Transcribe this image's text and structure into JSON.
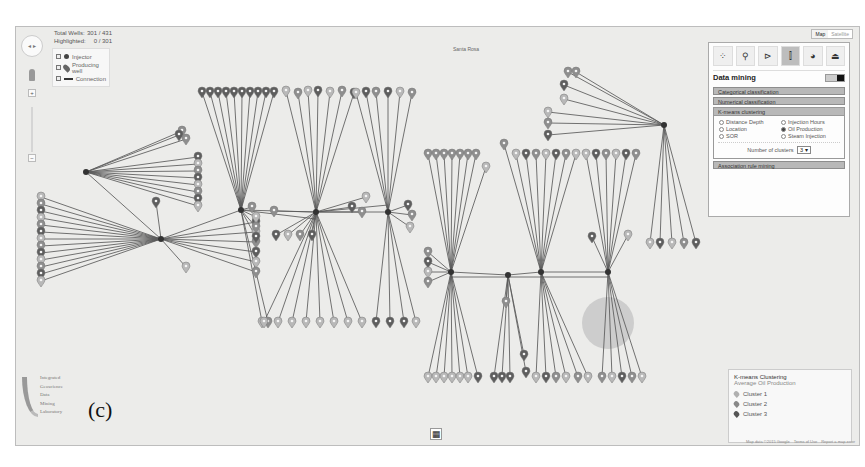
{
  "window": {
    "figure_label": "(c)"
  },
  "map": {
    "place_label": "Santa Rosa",
    "map_type": {
      "options": [
        "Map",
        "Satellite"
      ],
      "selected": "Map"
    },
    "credits": [
      "Map data ©2015 Google",
      "Terms of Use",
      "Report a map error"
    ],
    "view_grid_icon": "grid-icon"
  },
  "stats": {
    "total_label": "Total Wells:",
    "total_value": "301 / 431",
    "highlighted_label": "Highlighted:",
    "highlighted_value": "0 / 301"
  },
  "layer_legend": {
    "items": [
      {
        "label": "Injector",
        "icon": "dot-icon",
        "checked": true
      },
      {
        "label": "Producing well",
        "icon": "pin-icon",
        "checked": true
      },
      {
        "label": "Connection",
        "icon": "line-icon",
        "checked": true
      }
    ]
  },
  "controls": {
    "zoom_in": "+",
    "zoom_out": "−",
    "pan_icon": "pan-icon",
    "pegman_icon": "pegman-icon"
  },
  "panel": {
    "tools": [
      {
        "name": "scatter-icon",
        "glyph": "⁘"
      },
      {
        "name": "search-icon",
        "glyph": "⚲"
      },
      {
        "name": "flow-icon",
        "glyph": "⊳"
      },
      {
        "name": "data-mining-icon",
        "glyph": "⫿",
        "active": true
      },
      {
        "name": "pie-icon",
        "glyph": "◕"
      },
      {
        "name": "well-icon",
        "glyph": "⏏"
      }
    ],
    "title": "Data mining",
    "sections": {
      "categorical": "Categorical classification",
      "numerical": "Numerical classification",
      "kmeans": "K-means clustering",
      "association": "Association rule mining"
    },
    "kmeans_options": [
      {
        "label": "Distance Depth",
        "selected": false
      },
      {
        "label": "Injection Hours",
        "selected": false
      },
      {
        "label": "Location",
        "selected": false
      },
      {
        "label": "Oil Production",
        "selected": true
      },
      {
        "label": "SOR",
        "selected": false
      },
      {
        "label": "Steam Injection",
        "selected": false
      }
    ],
    "num_clusters_label": "Number of clusters",
    "num_clusters_value": "3 ▾"
  },
  "cluster_legend": {
    "title": "K-means Clustering",
    "subtitle": "Average Oil Production",
    "clusters": [
      {
        "label": "Cluster 1",
        "color": "#b0b0b0"
      },
      {
        "label": "Cluster 2",
        "color": "#888888"
      },
      {
        "label": "Cluster 3",
        "color": "#555555"
      }
    ]
  },
  "logo": {
    "lines": [
      "Integrated",
      "Geoscience",
      "Data",
      "Mining",
      "Laboratory"
    ]
  },
  "network": {
    "colors": {
      "line": "#5a5a5a",
      "pin_light": "#b8b8b8",
      "pin_mid": "#8e8e8e",
      "pin_dark": "#5e5e5e"
    },
    "hubs": [
      {
        "x": 70,
        "y": 145,
        "fan": [
          [
            166,
            104
          ],
          [
            163,
            108
          ],
          [
            170,
            112
          ],
          [
            182,
            130
          ],
          [
            182,
            137
          ],
          [
            182,
            144
          ],
          [
            182,
            151
          ],
          [
            182,
            158
          ],
          [
            182,
            165
          ],
          [
            182,
            172
          ],
          [
            182,
            179
          ]
        ]
      },
      {
        "x": 145,
        "y": 212,
        "fan": [
          [
            25,
            170
          ],
          [
            25,
            177
          ],
          [
            25,
            184
          ],
          [
            25,
            191
          ],
          [
            25,
            198
          ],
          [
            25,
            205
          ],
          [
            25,
            212
          ],
          [
            25,
            219
          ],
          [
            25,
            226
          ],
          [
            25,
            233
          ],
          [
            25,
            240
          ],
          [
            25,
            247
          ],
          [
            25,
            254
          ],
          [
            140,
            175
          ],
          [
            170,
            240
          ],
          [
            240,
            195
          ],
          [
            240,
            205
          ],
          [
            240,
            215
          ],
          [
            240,
            225
          ],
          [
            240,
            235
          ],
          [
            240,
            245
          ]
        ]
      },
      {
        "x": 225,
        "y": 183,
        "fan": [
          [
            186,
            65
          ],
          [
            194,
            65
          ],
          [
            202,
            65
          ],
          [
            210,
            65
          ],
          [
            218,
            65
          ],
          [
            226,
            65
          ],
          [
            234,
            65
          ],
          [
            242,
            65
          ],
          [
            250,
            65
          ],
          [
            258,
            65
          ],
          [
            246,
            295
          ],
          [
            252,
            295
          ],
          [
            236,
            180
          ],
          [
            240,
            190
          ],
          [
            240,
            200
          ],
          [
            240,
            210
          ]
        ]
      },
      {
        "x": 300,
        "y": 185,
        "fan": [
          [
            270,
            64
          ],
          [
            282,
            66
          ],
          [
            292,
            64
          ],
          [
            302,
            64
          ],
          [
            314,
            65
          ],
          [
            326,
            64
          ],
          [
            338,
            66
          ],
          [
            248,
            295
          ],
          [
            262,
            295
          ],
          [
            276,
            295
          ],
          [
            290,
            295
          ],
          [
            304,
            295
          ],
          [
            318,
            295
          ],
          [
            332,
            295
          ],
          [
            346,
            295
          ],
          [
            260,
            208
          ],
          [
            272,
            208
          ],
          [
            284,
            208
          ],
          [
            296,
            208
          ],
          [
            258,
            184
          ],
          [
            336,
            180
          ],
          [
            346,
            185
          ],
          [
            350,
            170
          ]
        ]
      },
      {
        "x": 372,
        "y": 185,
        "fan": [
          [
            340,
            66
          ],
          [
            350,
            65
          ],
          [
            360,
            65
          ],
          [
            372,
            65
          ],
          [
            384,
            65
          ],
          [
            396,
            66
          ],
          [
            360,
            295
          ],
          [
            374,
            295
          ],
          [
            388,
            295
          ],
          [
            400,
            295
          ],
          [
            392,
            178
          ],
          [
            396,
            188
          ],
          [
            394,
            200
          ]
        ]
      },
      {
        "x": 435,
        "y": 245,
        "fan": [
          [
            412,
            127
          ],
          [
            420,
            127
          ],
          [
            428,
            127
          ],
          [
            436,
            127
          ],
          [
            444,
            127
          ],
          [
            452,
            127
          ],
          [
            460,
            127
          ],
          [
            470,
            140
          ],
          [
            412,
            350
          ],
          [
            420,
            350
          ],
          [
            428,
            350
          ],
          [
            436,
            350
          ],
          [
            444,
            350
          ],
          [
            452,
            350
          ],
          [
            462,
            350
          ],
          [
            412,
            225
          ],
          [
            412,
            235
          ],
          [
            412,
            245
          ],
          [
            412,
            255
          ]
        ]
      },
      {
        "x": 492,
        "y": 248,
        "fan": [
          [
            478,
            350
          ],
          [
            486,
            350
          ],
          [
            494,
            350
          ],
          [
            508,
            328
          ],
          [
            510,
            345
          ],
          [
            490,
            275
          ]
        ]
      },
      {
        "x": 525,
        "y": 245,
        "fan": [
          [
            500,
            127
          ],
          [
            510,
            127
          ],
          [
            520,
            127
          ],
          [
            530,
            127
          ],
          [
            540,
            127
          ],
          [
            550,
            127
          ],
          [
            560,
            127
          ],
          [
            520,
            350
          ],
          [
            530,
            350
          ],
          [
            540,
            350
          ],
          [
            550,
            350
          ],
          [
            562,
            350
          ],
          [
            572,
            350
          ],
          [
            488,
            117
          ]
        ]
      },
      {
        "x": 592,
        "y": 245,
        "fan": [
          [
            570,
            127
          ],
          [
            580,
            127
          ],
          [
            590,
            127
          ],
          [
            600,
            127
          ],
          [
            610,
            127
          ],
          [
            620,
            127
          ],
          [
            586,
            350
          ],
          [
            596,
            350
          ],
          [
            606,
            350
          ],
          [
            616,
            350
          ],
          [
            626,
            350
          ],
          [
            576,
            210
          ],
          [
            612,
            208
          ]
        ]
      },
      {
        "x": 648,
        "y": 98,
        "fan": [
          [
            552,
            45
          ],
          [
            560,
            45
          ],
          [
            548,
            58
          ],
          [
            548,
            72
          ],
          [
            532,
            85
          ],
          [
            532,
            96
          ],
          [
            532,
            108
          ],
          [
            634,
            216
          ],
          [
            644,
            216
          ],
          [
            656,
            216
          ],
          [
            668,
            216
          ],
          [
            680,
            216
          ]
        ]
      }
    ],
    "links": [
      [
        70,
        145,
        145,
        212
      ],
      [
        145,
        212,
        225,
        183
      ],
      [
        225,
        183,
        300,
        185
      ],
      [
        300,
        185,
        372,
        185
      ],
      [
        435,
        245,
        492,
        248
      ],
      [
        492,
        248,
        525,
        245
      ],
      [
        525,
        245,
        592,
        245
      ],
      [
        225,
        183,
        300,
        192
      ],
      [
        300,
        185,
        372,
        178
      ],
      [
        435,
        250,
        592,
        250
      ]
    ],
    "blobs": [
      {
        "x": 566,
        "y": 270,
        "w": 52,
        "h": 52
      }
    ]
  }
}
